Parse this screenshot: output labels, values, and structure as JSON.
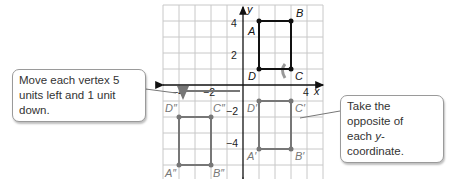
{
  "diagram": {
    "grid": {
      "x_min": -5,
      "x_max": 5,
      "y_min": -6,
      "y_max": 5,
      "unit_px": 16,
      "origin_px": [
        243,
        85
      ]
    },
    "axes": {
      "x_label": "x",
      "y_label": "y",
      "x_ticks": [
        "-4",
        "-2",
        "4"
      ],
      "y_ticks": [
        "4",
        "2",
        "-2",
        "-4"
      ]
    },
    "figures": [
      {
        "name": "ABCD",
        "color": "#1a1a1a",
        "vertices": [
          {
            "label": "A",
            "x": 1,
            "y": 4
          },
          {
            "label": "B",
            "x": 3,
            "y": 4
          },
          {
            "label": "C",
            "x": 3,
            "y": 1
          },
          {
            "label": "D",
            "x": 1,
            "y": 1
          }
        ]
      },
      {
        "name": "A'B'C'D'",
        "color": "#7a7a7a",
        "vertices": [
          {
            "label": "A'",
            "x": 1,
            "y": -4
          },
          {
            "label": "B'",
            "x": 3,
            "y": -4
          },
          {
            "label": "C'",
            "x": 3,
            "y": -1
          },
          {
            "label": "D'",
            "x": 1,
            "y": -1
          }
        ]
      },
      {
        "name": "A''B''C''D''",
        "color": "#7a7a7a",
        "vertices": [
          {
            "label": "A''",
            "x": -4,
            "y": -5
          },
          {
            "label": "B''",
            "x": -2,
            "y": -5
          },
          {
            "label": "C''",
            "x": -2,
            "y": -2
          },
          {
            "label": "D''",
            "x": -4,
            "y": -2
          }
        ]
      }
    ],
    "callouts": {
      "left": "Move each vertex 5 units left and 1 unit down.",
      "right_line1": "Take the opposite of",
      "right_line2_pre": "each ",
      "right_line2_var": "y",
      "right_line2_post": "-coordinate."
    }
  }
}
